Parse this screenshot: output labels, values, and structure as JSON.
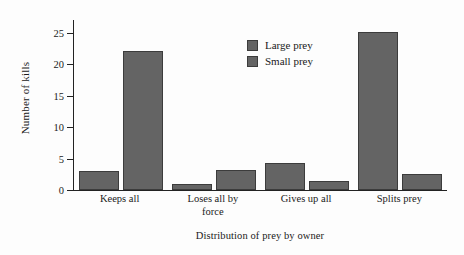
{
  "chart_data": {
    "type": "bar",
    "title": "",
    "subtitle": "",
    "xlabel": "Distribution of prey by owner",
    "ylabel": "Number of kills",
    "categories": [
      "Keeps all",
      "Loses all by force",
      "Gives up all",
      "Splits prey"
    ],
    "category_lines": [
      [
        "Keeps all"
      ],
      [
        "Loses all by",
        "force"
      ],
      [
        "Gives up all"
      ],
      [
        "Splits prey"
      ]
    ],
    "series": [
      {
        "name": "Large prey",
        "values": [
          3,
          1,
          4.3,
          25.1
        ],
        "color": "#646464"
      },
      {
        "name": "Small prey",
        "values": [
          22,
          3.2,
          1.4,
          2.5
        ],
        "color": "#646464"
      }
    ],
    "ylim": [
      0,
      27
    ],
    "yticks": [
      0,
      5,
      10,
      15,
      20,
      25
    ],
    "ytick_labels": [
      "0",
      "5",
      "10",
      "15",
      "20",
      "25"
    ],
    "grid": false,
    "legend_position": "upper center",
    "background_color": "#fdfdfd",
    "axis_color": "#222222",
    "bar_edge_color": "#3c3c3c"
  },
  "legend": {
    "entries": [
      {
        "label": "Large prey"
      },
      {
        "label": "Small prey"
      }
    ]
  }
}
